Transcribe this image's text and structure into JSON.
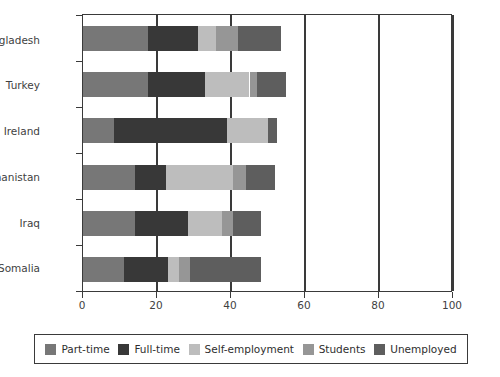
{
  "chart_data": {
    "type": "bar",
    "orientation": "horizontal",
    "stacked": true,
    "title": "",
    "subtitle": "",
    "xlabel": "",
    "ylabel": "",
    "xlim": [
      0,
      100
    ],
    "xticks": [
      0,
      20,
      40,
      60,
      80,
      100
    ],
    "xtick_labels": [
      "0",
      "20",
      "40",
      "60",
      "80",
      "100"
    ],
    "grid": "vertical",
    "legend_position": "bottom",
    "categories": [
      "Bangladesh",
      "Turkey",
      "Ireland",
      "Afghanistan",
      "Iraq",
      "Somalia"
    ],
    "series": [
      {
        "name": "Part-time",
        "color": "#777777",
        "values": [
          17.5,
          17.5,
          8.5,
          14.0,
          14.0,
          11.0
        ]
      },
      {
        "name": "Full-time",
        "color": "#383838",
        "values": [
          13.5,
          15.5,
          30.5,
          8.5,
          14.5,
          12.0
        ]
      },
      {
        "name": "Self-employment",
        "color": "#bdbdbd",
        "values": [
          5.0,
          12.0,
          11.0,
          18.0,
          9.0,
          3.0
        ]
      },
      {
        "name": "Students",
        "color": "#969696",
        "values": [
          6.0,
          2.0,
          0.0,
          3.5,
          3.0,
          3.0
        ]
      },
      {
        "name": "Unemployed",
        "color": "#5e5e5e",
        "values": [
          11.5,
          8.0,
          2.5,
          8.0,
          7.5,
          19.0
        ]
      }
    ],
    "totals": [
      53.5,
      55.0,
      52.5,
      52.0,
      48.0,
      48.0
    ]
  },
  "legend": {
    "items": [
      {
        "label": "Part-time",
        "color": "#777777"
      },
      {
        "label": "Full-time",
        "color": "#383838"
      },
      {
        "label": "Self-employment",
        "color": "#bdbdbd"
      },
      {
        "label": "Students",
        "color": "#969696"
      },
      {
        "label": "Unemployed",
        "color": "#5e5e5e"
      }
    ]
  },
  "axis": {
    "x_tick_labels": [
      "0",
      "20",
      "40",
      "60",
      "80",
      "100"
    ],
    "y_tick_labels": [
      "Bangladesh",
      "Turkey",
      "Ireland",
      "Afghanistan",
      "Iraq",
      "Somalia"
    ]
  },
  "style": {
    "axis_color": "#3a3a3a",
    "text_color": "#3f3f3f",
    "background": "#ffffff"
  }
}
